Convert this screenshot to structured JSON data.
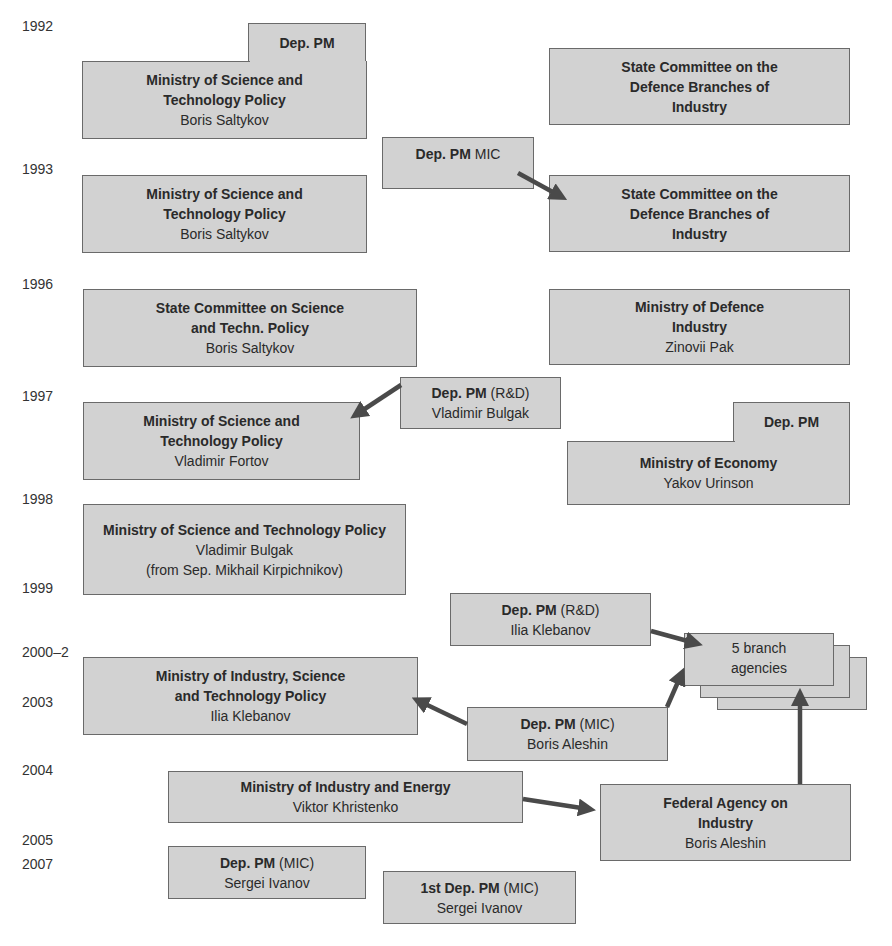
{
  "years": [
    "1992",
    "1993",
    "1996",
    "1997",
    "1998",
    "1999",
    "2000–2",
    "2003",
    "2004",
    "2005",
    "2007"
  ],
  "boxes": {
    "deppm_1992": {
      "bold": "Dep. PM",
      "rest": ""
    },
    "mstp_1992": {
      "title_l1": "Ministry of Science and",
      "title_l2": "Technology Policy",
      "person": "Boris Saltykov"
    },
    "scdbi_1992": {
      "title_l1": "State Committee on the",
      "title_l2": "Defence Branches of",
      "title_l3": "Industry"
    },
    "deppm_mic_1993": {
      "bold": "Dep. PM",
      "rest": " MIC"
    },
    "mstp_1993": {
      "title_l1": "Ministry of Science and",
      "title_l2": "Technology Policy",
      "person": "Boris Saltykov"
    },
    "scdbi_1993": {
      "title_l1": "State Committee on the",
      "title_l2": "Defence Branches of",
      "title_l3": "Industry"
    },
    "scstp_1996": {
      "title_l1": "State Committee on Science",
      "title_l2": "and Techn. Policy",
      "person": "Boris Saltykov"
    },
    "mdi_1996": {
      "title_l1": "Ministry of Defence",
      "title_l2": "Industry",
      "person": "Zinovii Pak"
    },
    "deppm_rd_1997": {
      "bold": "Dep. PM",
      "rest": " (R&D)",
      "person": "Vladimir Bulgak"
    },
    "mstp_1997": {
      "title_l1": "Ministry of Science and",
      "title_l2": "Technology Policy",
      "person": "Vladimir Fortov"
    },
    "deppm_econ_1997": {
      "bold": "Dep. PM",
      "rest": ""
    },
    "me_1997": {
      "title_l1": "Ministry of Economy",
      "person": "Yakov Urinson"
    },
    "mstp_1998": {
      "title_l1": "Ministry of Science and Technology Policy",
      "person": "Vladimir Bulgak",
      "note": "(from Sep. Mikhail Kirpichnikov)"
    },
    "deppm_rd_2000": {
      "bold": "Dep. PM",
      "rest": " (R&D)",
      "person": "Ilia Klebanov"
    },
    "branch_agencies": {
      "label_l1": "5 branch",
      "label_l2": "agencies"
    },
    "mistp_2000": {
      "title_l1": "Ministry of Industry, Science",
      "title_l2": "and Technology Policy",
      "person": "Ilia Klebanov"
    },
    "deppm_mic_2003": {
      "bold": "Dep. PM",
      "rest": " (MIC)",
      "person": "Boris Aleshin"
    },
    "mie_2004": {
      "title_l1": "Ministry of Industry and Energy",
      "person": "Viktor Khristenko"
    },
    "fai_2004": {
      "title_l1": "Federal Agency on",
      "title_l2": "Industry",
      "person": "Boris Aleshin"
    },
    "deppm_mic_2005": {
      "bold": "Dep. PM",
      "rest": " (MIC)",
      "person": "Sergei Ivanov"
    },
    "firstdeppm_mic_2007": {
      "bold": "1st Dep. PM",
      "rest": " (MIC)",
      "person": "Sergei Ivanov"
    }
  },
  "colors": {
    "box_fill": "#d2d2d2",
    "box_border": "#6a6a6a",
    "arrow": "#4a4a4a"
  }
}
